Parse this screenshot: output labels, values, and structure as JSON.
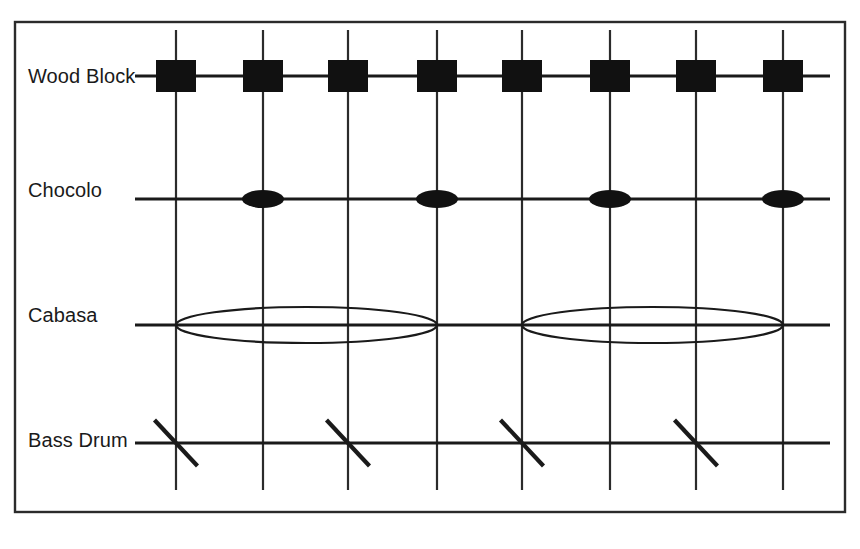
{
  "figure": {
    "kind": "percussion-rhythm-grid",
    "background_color": "#ffffff",
    "ink_color": "#1a1a1a",
    "frame": {
      "x": 15,
      "y": 22,
      "width": 830,
      "height": 490,
      "stroke": "#2b2b2b"
    },
    "beat_gridlines": {
      "count": 8,
      "x_positions": [
        176,
        263,
        348,
        437,
        522,
        610,
        696,
        783
      ],
      "y_top": 30,
      "y_bottom": 490,
      "stroke": "#2b2b2b"
    },
    "staff_x_start": 135,
    "staff_x_end": 830
  },
  "chart_data": {
    "type": "table",
    "xlabel": "Beat position",
    "ylabel": "Instrument",
    "grid": true,
    "legend": "none",
    "categories": [
      "1",
      "2",
      "3",
      "4",
      "5",
      "6",
      "7",
      "8"
    ],
    "x": [
      176,
      263,
      348,
      437,
      522,
      610,
      696,
      783
    ],
    "series": [
      {
        "name": "Wood Block",
        "notation": "filled-rectangle",
        "values": [
          1,
          1,
          1,
          1,
          1,
          1,
          1,
          1
        ],
        "hit_beats": [
          1,
          2,
          3,
          4,
          5,
          6,
          7,
          8
        ]
      },
      {
        "name": "Chocolo",
        "notation": "filled-ellipse",
        "values": [
          0,
          1,
          0,
          1,
          0,
          1,
          0,
          1
        ],
        "hit_beats": [
          2,
          4,
          6,
          8
        ]
      },
      {
        "name": "Cabasa",
        "notation": "open-ellipse-sustain",
        "values": [
          1,
          0,
          0,
          0,
          1,
          0,
          0,
          0
        ],
        "hit_beats": [
          1,
          5
        ],
        "sustain_spans": [
          [
            1,
            4
          ],
          [
            5,
            8
          ]
        ]
      },
      {
        "name": "Bass Drum",
        "notation": "diagonal-slash",
        "values": [
          1,
          0,
          1,
          0,
          1,
          0,
          1,
          0
        ],
        "hit_beats": [
          1,
          3,
          5,
          7
        ]
      }
    ]
  },
  "staves": [
    {
      "id": "wood-block",
      "label": "Wood Block",
      "label_x": 28,
      "label_y": 83,
      "line_y": 76,
      "note_type": "rect",
      "note_width": 40,
      "note_height": 32,
      "notes_x": [
        176,
        263,
        348,
        437,
        522,
        610,
        696,
        783
      ]
    },
    {
      "id": "chocolo",
      "label": "Chocolo",
      "label_x": 28,
      "label_y": 197,
      "line_y": 199,
      "note_type": "ellipse-filled",
      "note_rx": 21,
      "note_ry": 9,
      "notes_x": [
        263,
        437,
        610,
        783
      ]
    },
    {
      "id": "cabasa",
      "label": "Cabasa",
      "label_x": 28,
      "label_y": 322,
      "line_y": 325,
      "note_type": "ellipse-open",
      "note_ry": 18,
      "spans": [
        {
          "x_start": 176,
          "x_end": 437
        },
        {
          "x_start": 522,
          "x_end": 783
        }
      ]
    },
    {
      "id": "bass-drum",
      "label": "Bass Drum",
      "label_x": 28,
      "label_y": 447,
      "line_y": 443,
      "note_type": "slash",
      "slash_dx": 43,
      "slash_dy": 46,
      "notes_x": [
        176,
        348,
        522,
        696
      ]
    }
  ]
}
